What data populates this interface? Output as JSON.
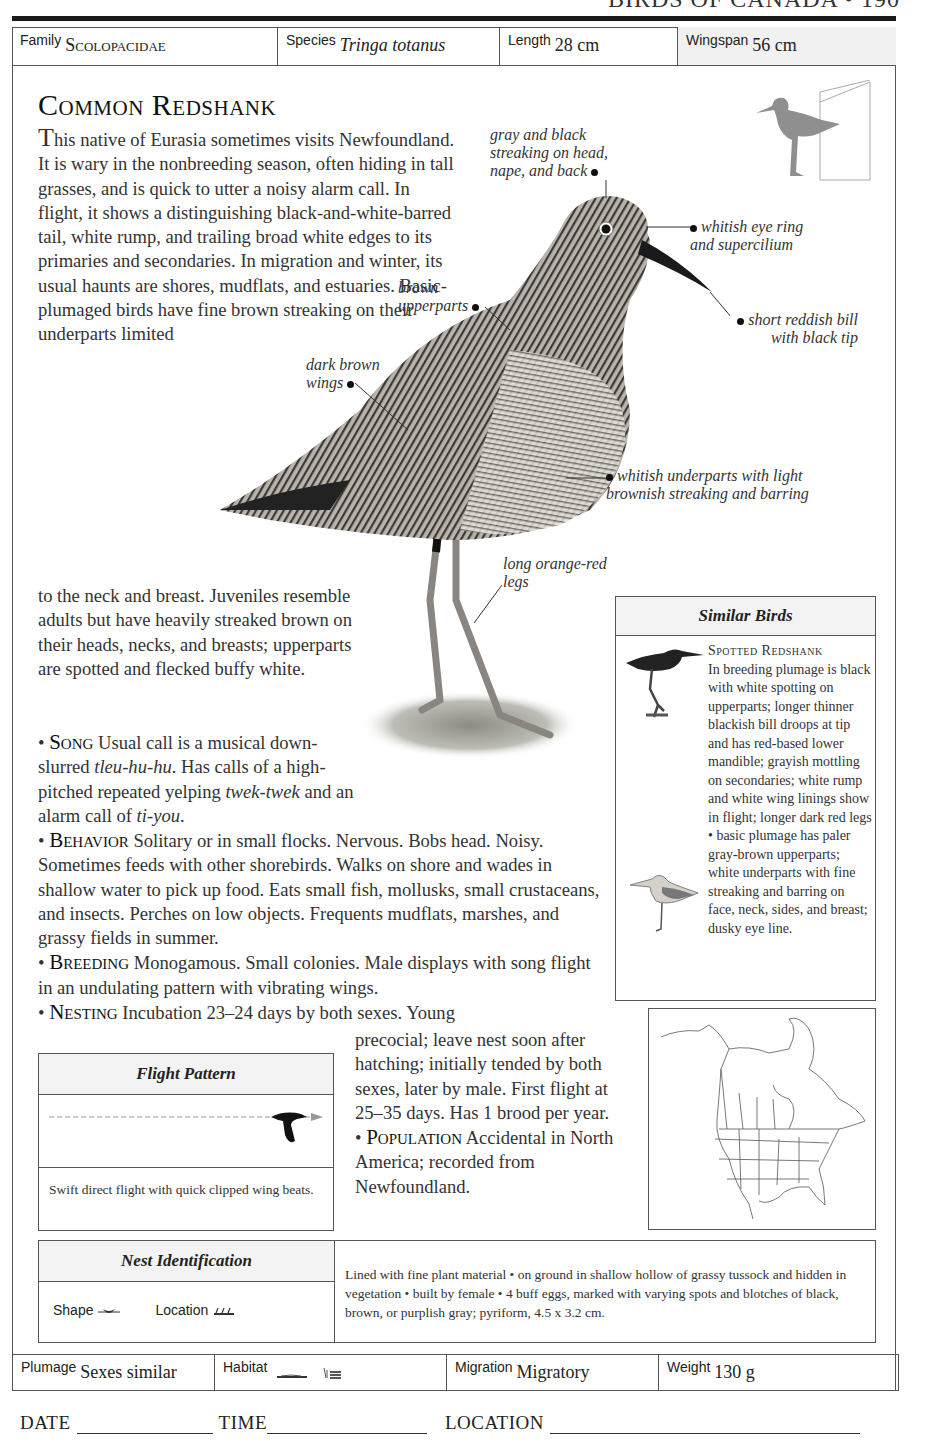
{
  "running_head": "BIRDS OF CANADA • 190",
  "top_row": {
    "family_label": "Family",
    "family_value": "Scolopacidae",
    "species_label": "Species",
    "species_value": "Tringa totanus",
    "length_label": "Length",
    "length_value": "28 cm",
    "wingspan_label": "Wingspan",
    "wingspan_value": "56 cm"
  },
  "title": "Common Redshank",
  "intro": {
    "dropcap": "T",
    "text_part1": "his native of Eurasia sometimes visits Newfoundland. It is wary in the nonbreeding season, often hiding in tall grasses, and is quick to utter a noisy alarm call. In flight, it shows a distinguishing black-and-white-barred tail, white rump, and trailing broad white edges to its primaries and secondaries. In migration and winter, its usual haunts are shores, mudflats, and estuaries. Basic-plumaged birds have fine brown streaking on their underparts limited",
    "text_part2": "to the neck and breast. Juveniles resemble adults but have heavily streaked brown on their heads, necks, and breasts; upperparts are spotted and flecked buffy white."
  },
  "sections": {
    "song": {
      "head": "Song",
      "t1": " Usual call is a musical down-slurred ",
      "i1": "tleu-hu-hu",
      "t2": ". Has calls of a high-pitched repeated yelping ",
      "i2": "twek-twek",
      "t3": " and an alarm call of ",
      "i3": "ti-you",
      "t4": "."
    },
    "behavior": {
      "head": "Behavior",
      "text": " Solitary or in small flocks. Nervous. Bobs head. Noisy. Sometimes feeds with other shorebirds. Walks on shore and wades in shallow water to pick up food. Eats small fish, mollusks, small crustaceans, and insects. Perches on low objects. Frequents mudflats, marshes, and grassy fields in summer."
    },
    "breeding": {
      "head": "Breeding",
      "text": " Monogamous. Small colonies. Male displays with song flight in an undulating pattern with vibrating wings."
    },
    "nesting": {
      "head": "Nesting",
      "text_line1": " Incubation 23–24 days by both sexes. Young",
      "text_rest": "precocial; leave nest soon after hatching; initially tended by both sexes, later by male. First flight at 25–35 days. Has 1 brood per year."
    },
    "population": {
      "head": "Population",
      "text": " Accidental in North America; recorded from Newfoundland."
    }
  },
  "callouts": {
    "head": "gray and black streaking on head, nape, and back",
    "eye": "whitish eye ring and supercilium",
    "bill": "short reddish bill with black tip",
    "upperparts": "brown upperparts",
    "wings": "dark brown wings",
    "underparts": "whitish underparts with light brownish streaking and barring",
    "legs": "long orange-red legs"
  },
  "similar_birds": {
    "heading": "Similar Birds",
    "name": "Spotted Redshank",
    "text": "In breeding plumage is black with white spotting on upperparts; longer thinner blackish bill droops at tip and has red-based lower mandible; grayish mottling on secondaries; white rump and white wing linings show in flight; longer dark red legs • basic plumage has paler gray-brown upperparts; white underparts with fine streaking and barring on face, neck, sides, and breast; dusky eye line."
  },
  "flight_pattern": {
    "heading": "Flight Pattern",
    "description": "Swift direct flight with quick clipped wing beats."
  },
  "nest_identification": {
    "heading": "Nest Identification",
    "shape_label": "Shape",
    "location_label": "Location",
    "description": "Lined with fine plant material • on ground in shallow hollow of grassy tussock and hidden in vegetation • built by female • 4 buff eggs, marked with varying spots and blotches of black, brown, or purplish gray; pyriform, 4.5 x 3.2 cm."
  },
  "bottom_row": {
    "plumage_label": "Plumage",
    "plumage_value": "Sexes similar",
    "habitat_label": "Habitat",
    "migration_label": "Migration",
    "migration_value": "Migratory",
    "weight_label": "Weight",
    "weight_value": "130 g"
  },
  "footer": {
    "date_label": "DATE",
    "time_label": "TIME",
    "location_label": "LOCATION"
  },
  "icons": {
    "nest_shape": "cup-nest-icon",
    "nest_location": "ground-grass-icon",
    "habitat_1": "shore-icon",
    "habitat_2": "marsh-water-icon",
    "size_silhouette": "bird-size-silhouette-icon"
  }
}
